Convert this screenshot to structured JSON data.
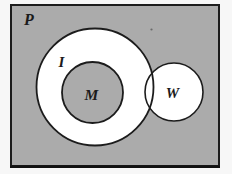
{
  "figure": {
    "type": "euler-diagram",
    "labels": {
      "universe": "P",
      "outer_set": "I",
      "inner_set": "M",
      "overlapping_set": "W"
    },
    "colors": {
      "page_background": "#f7f7f7",
      "region_gray": "#ababab",
      "region_white": "#ffffff",
      "stroke": "#1c1c1c",
      "label_text": "#1b1b1b"
    }
  }
}
